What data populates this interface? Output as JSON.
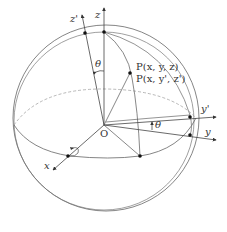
{
  "diagram": {
    "colors": {
      "line": "#555555",
      "dashed": "#999999",
      "point": "#111111",
      "text": "#333333"
    },
    "labels": {
      "z_axis": "z",
      "z_prime_axis": "z'",
      "y_axis": "y",
      "y_prime_axis": "y'",
      "x_axis": "x",
      "origin": "O",
      "theta_top": "θ",
      "theta_right": "θ",
      "point_original": "P(x, y, z)",
      "point_rotated": "P(x, y', z')"
    }
  }
}
